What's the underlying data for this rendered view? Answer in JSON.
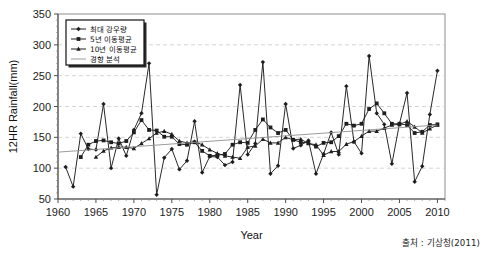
{
  "figure": {
    "source_note": "출처 : 기상청(2011)"
  },
  "chart_data": {
    "type": "line",
    "title": "",
    "xlabel": "Year",
    "ylabel": "12HR Rainfall(mm)",
    "xlim": [
      1960,
      2011
    ],
    "ylim": [
      50,
      350
    ],
    "ytick_values": [
      50,
      100,
      150,
      200,
      250,
      300,
      350
    ],
    "ytick_labels": [
      "50",
      "100",
      "150",
      "200",
      "250",
      "300",
      "350"
    ],
    "xtick_values": [
      1960,
      1965,
      1970,
      1975,
      1980,
      1985,
      1990,
      1995,
      2000,
      2005,
      2010
    ],
    "xtick_labels": [
      "1960",
      "1965",
      "1970",
      "1975",
      "1980",
      "1985",
      "1990",
      "1995",
      "2000",
      "2005",
      "2010"
    ],
    "grid": "horizontal-dashed",
    "legend_position": "upper-left",
    "legend": [
      "최대 강우량",
      "5년 이동평균",
      "10년 이동평균",
      "경향 분석"
    ],
    "x": [
      1961,
      1962,
      1963,
      1964,
      1965,
      1966,
      1967,
      1968,
      1969,
      1970,
      1971,
      1972,
      1973,
      1974,
      1975,
      1976,
      1977,
      1978,
      1979,
      1980,
      1981,
      1982,
      1983,
      1984,
      1985,
      1986,
      1987,
      1988,
      1989,
      1990,
      1991,
      1992,
      1993,
      1994,
      1995,
      1996,
      1997,
      1998,
      1999,
      2000,
      2001,
      2002,
      2003,
      2004,
      2005,
      2006,
      2007,
      2008,
      2009,
      2010
    ],
    "series": [
      {
        "name": "최대 강우량",
        "marker": "filled-diamond",
        "values": [
          102,
          70,
          156,
          131,
          130,
          204,
          100,
          148,
          120,
          162,
          189,
          270,
          57,
          117,
          131,
          98,
          112,
          176,
          93,
          119,
          118,
          105,
          110,
          235,
          122,
          140,
          272,
          91,
          104,
          204,
          132,
          137,
          145,
          91,
          123,
          158,
          122,
          233,
          143,
          124,
          282,
          189,
          171,
          107,
          172,
          222,
          78,
          103,
          187,
          258
        ]
      },
      {
        "name": "5년 이동평균",
        "marker": "filled-square",
        "values": [
          null,
          null,
          118,
          138,
          144,
          145,
          142,
          140,
          144,
          158,
          178,
          162,
          161,
          151,
          151,
          139,
          138,
          142,
          128,
          120,
          121,
          123,
          138,
          142,
          141,
          162,
          179,
          166,
          157,
          162,
          146,
          142,
          141,
          135,
          141,
          142,
          152,
          172,
          169,
          172,
          196,
          205,
          189,
          172,
          172,
          170,
          157,
          159,
          170,
          171
        ]
      },
      {
        "name": "10년 이동평균",
        "marker": "filled-triangle",
        "values": [
          null,
          null,
          null,
          null,
          118,
          128,
          133,
          134,
          134,
          132,
          140,
          148,
          157,
          160,
          155,
          144,
          141,
          143,
          138,
          130,
          124,
          120,
          118,
          116,
          134,
          136,
          147,
          141,
          141,
          150,
          146,
          147,
          140,
          138,
          121,
          127,
          127,
          139,
          143,
          152,
          160,
          160,
          165,
          170,
          171,
          176,
          167,
          157,
          164,
          170
        ]
      },
      {
        "name": "경향 분석",
        "marker": "none",
        "trend": true,
        "endpoints": [
          [
            1960,
            126
          ],
          [
            2010,
            170
          ]
        ],
        "values": [
          126.9,
          127.8,
          128.7,
          129.6,
          130.5,
          131.4,
          132.3,
          133.2,
          134.1,
          135.0,
          135.9,
          136.8,
          137.7,
          138.6,
          139.5,
          140.4,
          141.3,
          142.2,
          143.1,
          144.0,
          144.9,
          145.8,
          146.7,
          147.6,
          148.5,
          149.4,
          150.3,
          151.2,
          152.1,
          153.0,
          153.9,
          154.8,
          155.7,
          156.6,
          157.5,
          158.4,
          159.3,
          160.2,
          161.1,
          162.0,
          162.9,
          163.8,
          164.7,
          165.6,
          166.5,
          167.4,
          168.3,
          169.2,
          170.1,
          171.0
        ]
      }
    ]
  }
}
